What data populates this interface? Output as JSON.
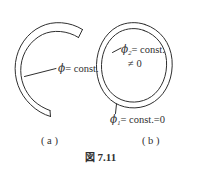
{
  "figure": {
    "caption_prefix": "図",
    "caption_number": "7.11",
    "caption_full": "図 7.11",
    "background_color": "#ffffff",
    "ink_color": "#2f2f2f",
    "panels": [
      {
        "id": "a",
        "sublabel": "( a )",
        "shape": "open-c-ring",
        "description": "open C-shaped ring with gap on the right side",
        "labels": [
          {
            "name": "phi-const",
            "phi": "ϕ",
            "subscript": "",
            "text": "= const.",
            "full": "ϕ = const."
          }
        ]
      },
      {
        "id": "b",
        "sublabel": "( b )",
        "shape": "closed-annular-ring",
        "description": "closed annular ring (torus cross-section)",
        "labels": [
          {
            "name": "phi2-const",
            "phi": "ϕ",
            "subscript": "2",
            "text": "= const.",
            "full": "ϕ₂ = const."
          },
          {
            "name": "neq-zero",
            "phi": "",
            "subscript": "",
            "text": "≠ 0",
            "full": "≠ 0"
          },
          {
            "name": "phi1-const-zero",
            "phi": "ϕ",
            "subscript": "1",
            "text": "= const.=0",
            "full": "ϕ₁ = const.=0"
          }
        ]
      }
    ]
  }
}
